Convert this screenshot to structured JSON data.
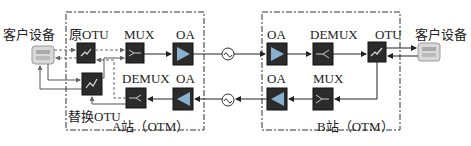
{
  "diagram": {
    "type": "optical transport network protection diagram",
    "station_a": {
      "label": "A站（OTM）",
      "client": "客户设备",
      "original_otu": "原OTU",
      "replacement_otu": "替换OTU",
      "mux": "MUX",
      "demux": "DEMUX",
      "oa_tx": "OA",
      "oa_rx": "OA"
    },
    "station_b": {
      "label": "B站（OTM）",
      "client": "客户设备",
      "otu": "OTU",
      "mux": "MUX",
      "demux": "DEMUX",
      "oa_rx": "OA",
      "oa_tx": "OA"
    },
    "colors": {
      "box_border": "#333333",
      "device_dark": "#2b2b2b",
      "client_device": "#dcdcdc",
      "line": "#222222",
      "dashed_line": "#555555"
    }
  }
}
